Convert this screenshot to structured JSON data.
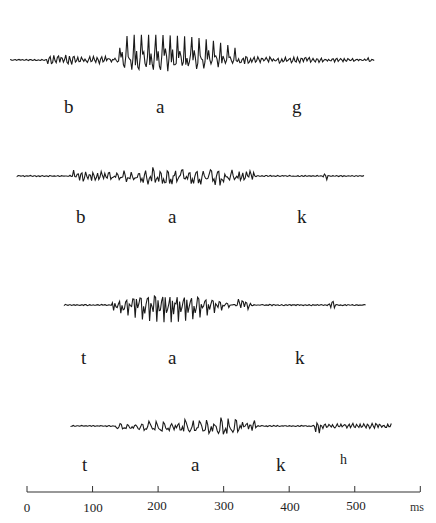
{
  "chart_data": {
    "type": "line",
    "title": "",
    "xlabel": "ms",
    "ylabel": "",
    "xlim": [
      0,
      600
    ],
    "x_ticks": [
      0,
      100,
      200,
      300,
      400,
      500
    ],
    "x_tick_labels": [
      "0",
      "100",
      "200",
      "300",
      "400",
      "500"
    ],
    "x_unit": "ms",
    "grid": false,
    "legend": null,
    "series": [
      {
        "name": "bag",
        "segments": [
          "b",
          "a",
          "g"
        ],
        "label_x_ms": [
          105,
          205,
          410
        ],
        "waveform_start_ms": -25,
        "waveform_end_ms": 530,
        "vowel_start_ms": 130,
        "vowel_end_ms": 320,
        "voiced_prevoicing_ms": [
          30,
          130
        ],
        "voiced_closure_ms": [
          320,
          530
        ],
        "peak_amplitude": 1.0
      },
      {
        "name": "bak",
        "segments": [
          "b",
          "a",
          "k"
        ],
        "label_x_ms": [
          83,
          220,
          410
        ],
        "waveform_start_ms": -15,
        "waveform_end_ms": 515,
        "vowel_start_ms": 130,
        "vowel_end_ms": 325,
        "voiced_prevoicing_ms": [
          70,
          130
        ],
        "burst_ms": 455,
        "peak_amplitude": 0.85
      },
      {
        "name": "tak",
        "segments": [
          "t",
          "a",
          "k"
        ],
        "label_x_ms": [
          80,
          220,
          410
        ],
        "waveform_start_ms": 57,
        "waveform_end_ms": 517,
        "vowel_start_ms": 130,
        "vowel_end_ms": 320,
        "burst_ms": 465,
        "peak_amplitude": 0.9
      },
      {
        "name": "takh",
        "segments": [
          "t",
          "a",
          "k",
          "h"
        ],
        "label_x_ms": [
          80,
          240,
          380,
          475
        ],
        "waveform_start_ms": 67,
        "waveform_end_ms": 557,
        "vowel_start_ms": 135,
        "vowel_end_ms": 330,
        "aspiration_ms": [
          440,
          557
        ],
        "peak_amplitude": 0.85
      }
    ]
  },
  "rows": [
    {
      "labels": [
        "b",
        "a",
        "g"
      ]
    },
    {
      "labels": [
        "b",
        "a",
        "k"
      ]
    },
    {
      "labels": [
        "t",
        "a",
        "k"
      ]
    },
    {
      "labels": [
        "t",
        "a",
        "k",
        "h"
      ]
    }
  ],
  "axis": {
    "ticks": [
      "0",
      "100",
      "200",
      "300",
      "400",
      "500"
    ],
    "unit": "ms"
  },
  "colors": {
    "ink": "#1a1a1a",
    "background": "#ffffff"
  }
}
